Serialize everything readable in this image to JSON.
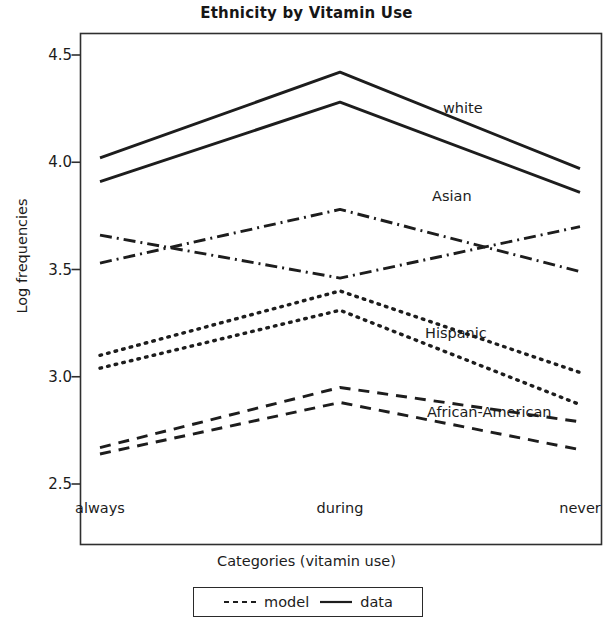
{
  "chart_data": {
    "type": "line",
    "title": "Ethnicity by Vitamin Use",
    "xlabel": "Categories (vitamin use)",
    "ylabel": "Log frequencies",
    "categories": [
      "always",
      "during",
      "never"
    ],
    "yticks": [
      "2.5",
      "3.0",
      "3.5",
      "4.0",
      "4.5"
    ],
    "ylim": [
      2.28,
      4.63
    ],
    "grid": false,
    "legend_position": "below-plot",
    "legend": [
      {
        "label": "model",
        "style": "dashed"
      },
      {
        "label": "data",
        "style": "solid"
      }
    ],
    "group_labels": [
      "white",
      "Asian",
      "Hispanic",
      "African-American"
    ],
    "series": [
      {
        "name": "white data",
        "group": "white",
        "kind": "data",
        "style": "solid",
        "values": [
          4.02,
          4.42,
          3.97
        ]
      },
      {
        "name": "white model",
        "group": "white",
        "kind": "model",
        "style": "solid",
        "values": [
          3.91,
          4.28,
          3.86
        ]
      },
      {
        "name": "Asian data",
        "group": "Asian",
        "kind": "data",
        "style": "dashdot",
        "values": [
          3.66,
          3.46,
          3.7
        ]
      },
      {
        "name": "Asian model",
        "group": "Asian",
        "kind": "model",
        "style": "dashdot",
        "values": [
          3.53,
          3.78,
          3.49
        ]
      },
      {
        "name": "Hispanic data",
        "group": "Hispanic",
        "kind": "data",
        "style": "dotted",
        "values": [
          3.1,
          3.4,
          3.02
        ]
      },
      {
        "name": "Hispanic model",
        "group": "Hispanic",
        "kind": "model",
        "style": "dotted",
        "values": [
          3.04,
          3.31,
          2.87
        ]
      },
      {
        "name": "African-American data",
        "group": "African-American",
        "kind": "data",
        "style": "dashed",
        "values": [
          2.67,
          2.95,
          2.79
        ]
      },
      {
        "name": "African-American model",
        "group": "African-American",
        "kind": "model",
        "style": "dashed",
        "values": [
          2.64,
          2.88,
          2.66
        ]
      }
    ],
    "annotations": [
      {
        "text": "white",
        "x_px": 443,
        "y_px": 100
      },
      {
        "text": "Asian",
        "x_px": 432,
        "y_px": 188
      },
      {
        "text": "Hispanic",
        "x_px": 425,
        "y_px": 325
      },
      {
        "text": "African-American",
        "x_px": 427,
        "y_px": 404
      }
    ],
    "colors": {
      "ink": "#1d1d1d",
      "axis": "#2f2f2f",
      "background": "#ffffff"
    }
  }
}
